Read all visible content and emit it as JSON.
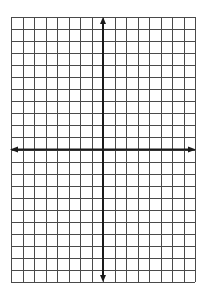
{
  "diagram": {
    "type": "coordinate-grid",
    "title": "",
    "canvas": {
      "width": 209,
      "height": 304,
      "background": "#ffffff"
    },
    "grid": {
      "left": 11,
      "top": 17,
      "right": 195,
      "bottom": 282,
      "columns": 16,
      "rows": 22,
      "line_color": "#4a4a4a",
      "line_width": 1
    },
    "axes": {
      "x_axis_row_index": 11,
      "y_axis_col_index": 8,
      "color": "#1a1a1a",
      "line_width": 2,
      "arrows": [
        "up",
        "down",
        "left",
        "right"
      ],
      "x_label": "",
      "y_label": ""
    }
  }
}
